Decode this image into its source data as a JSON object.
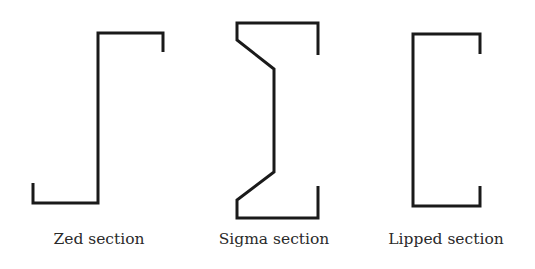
{
  "diagram": {
    "sections": [
      {
        "id": "zed",
        "label": "Zed section",
        "stroke": "#1a1a1a"
      },
      {
        "id": "sigma",
        "label": "Sigma section",
        "stroke": "#1a1a1a"
      },
      {
        "id": "lipped",
        "label": "Lipped section",
        "stroke": "#1a1a1a"
      }
    ]
  }
}
